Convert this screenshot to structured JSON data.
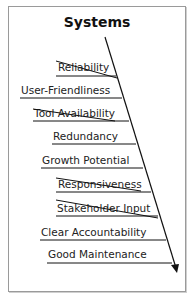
{
  "diagram": {
    "title": "Systems",
    "type": "fishbone-branch",
    "items": [
      {
        "label": "Reliability",
        "struck": true
      },
      {
        "label": "User-Friendliness",
        "struck": false
      },
      {
        "label": "Tool Availability",
        "struck": true
      },
      {
        "label": "Redundancy",
        "struck": false
      },
      {
        "label": "Growth Potential",
        "struck": false
      },
      {
        "label": "Responsiveness",
        "struck": true
      },
      {
        "label": "Stakeholder Input",
        "struck": true
      },
      {
        "label": "Clear Accountability",
        "struck": false
      },
      {
        "label": "Good Maintenance",
        "struck": false
      }
    ],
    "colors": {
      "line": "#111111",
      "text": "#222222",
      "border": "#9a9a9a"
    }
  }
}
